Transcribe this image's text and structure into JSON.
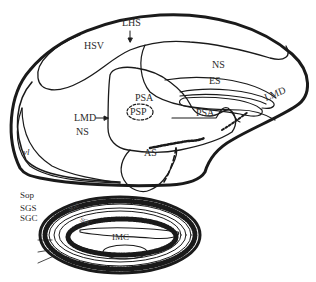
{
  "diagram": {
    "type": "anatomical-section",
    "colors": {
      "line": "#1a1a1a",
      "background": "#ffffff",
      "text": "#2b2b2b"
    },
    "labels": {
      "lhs": "LHS",
      "hsv": "HSV",
      "ns_upper": "NS",
      "es": "ES",
      "lmd_right": "LMD",
      "lmd_left": "LMD",
      "psa_upper": "PSA",
      "psp": "PSP",
      "psa_right": "PSA",
      "ns_left": "NS",
      "as": "AS",
      "vl": "vl",
      "sop": "Sop",
      "sgs": "SGS",
      "sgc": "SGC",
      "sgc_inner": "SGC",
      "imc": "IMC",
      "inner_small": "SGC"
    }
  }
}
